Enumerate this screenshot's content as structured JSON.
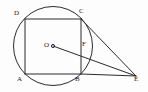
{
  "figure": {
    "type": "geometry-diagram",
    "background_color": "#fdfdfd",
    "stroke_color": "#2b2b2b",
    "label_color": "#1d1d1d",
    "canvas": {
      "width": 148,
      "height": 92
    },
    "circle": {
      "name": "circle-O",
      "center_label": "O",
      "cx": 53,
      "cy": 46,
      "r": 39.5
    },
    "points": [
      {
        "id": "D",
        "label": "D",
        "x": 25,
        "y": 19,
        "label_x": 14,
        "label_y": 10
      },
      {
        "id": "C",
        "label": "C",
        "x": 81,
        "y": 19,
        "label_x": 79,
        "label_y": 8
      },
      {
        "id": "A",
        "label": "A",
        "x": 25,
        "y": 74,
        "label_x": 17,
        "label_y": 76
      },
      {
        "id": "B",
        "label": "B",
        "x": 81,
        "y": 74,
        "label_x": 76,
        "label_y": 76
      },
      {
        "id": "O",
        "label": "O",
        "x": 53,
        "y": 46,
        "label_x": 44,
        "label_y": 42
      },
      {
        "id": "F",
        "label": "F",
        "x": 81,
        "y": 47,
        "label_x": 82,
        "label_y": 41
      },
      {
        "id": "E",
        "label": "E",
        "x": 136,
        "y": 76,
        "label_x": 135,
        "label_y": 76
      }
    ],
    "segments": [
      {
        "name": "side-AB",
        "from": "A",
        "to": "B"
      },
      {
        "name": "side-BC",
        "from": "B",
        "to": "C"
      },
      {
        "name": "side-CD",
        "from": "C",
        "to": "D"
      },
      {
        "name": "side-DA",
        "from": "D",
        "to": "A"
      },
      {
        "name": "segment-CE",
        "from": "C",
        "to": "E"
      },
      {
        "name": "segment-BE",
        "from": "B",
        "to": "E"
      },
      {
        "name": "segment-OE",
        "from": "O",
        "to": "E"
      }
    ]
  }
}
